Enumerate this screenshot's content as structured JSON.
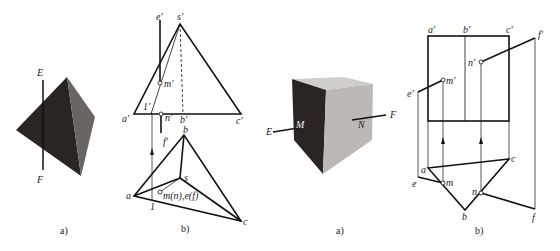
{
  "figure_left": {
    "panel_a": {
      "caption": "a)",
      "line_top_label": "E",
      "line_bottom_label": "F"
    },
    "panel_b": {
      "caption": "b)",
      "labels": {
        "e_prime": "e'",
        "s_prime": "s'",
        "m_prime": "m'",
        "one_prime": "1'",
        "a_prime": "a'",
        "n_prime": "n'",
        "b_prime": "b'",
        "c_prime": "c'",
        "f_prime": "f'",
        "b": "b",
        "s": "s",
        "a": "a",
        "one": "1",
        "mn_ef": "m(n),e(f)",
        "c": "c"
      }
    }
  },
  "figure_right": {
    "panel_a": {
      "caption": "a)",
      "line_left_label": "E",
      "line_right_label": "F",
      "face_left_label": "M",
      "face_right_label": "N"
    },
    "panel_b": {
      "caption": "b)",
      "labels": {
        "a_prime": "a'",
        "b_prime": "b'",
        "c_prime": "c'",
        "f_prime": "f'",
        "n_prime": "n'",
        "m_prime": "m'",
        "e_prime": "e'",
        "c": "c",
        "a": "a",
        "e": "e",
        "m": "m",
        "n": "n",
        "b": "b",
        "f": "f"
      }
    }
  }
}
